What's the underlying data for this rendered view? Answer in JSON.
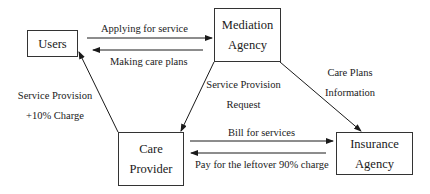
{
  "diagram": {
    "nodes": {
      "users": {
        "lines": [
          "Users"
        ]
      },
      "mediation": {
        "lines": [
          "Mediation",
          "Agency"
        ]
      },
      "care": {
        "lines": [
          "Care",
          "Provider"
        ]
      },
      "insurance": {
        "lines": [
          "Insurance",
          "Agency"
        ]
      }
    },
    "edges": {
      "applying": {
        "label": "Applying for service",
        "from": "Users",
        "to": "Mediation Agency"
      },
      "making_plans": {
        "label": "Making care plans",
        "from": "Mediation Agency",
        "to": "Users"
      },
      "service_provision": {
        "label_lines": [
          "Service Provision",
          "+10% Charge"
        ],
        "from": "Care Provider",
        "to": "Users"
      },
      "service_request": {
        "label_lines": [
          "Service Provision",
          "Request"
        ],
        "from": "Mediation Agency",
        "to": "Care Provider"
      },
      "care_plans_info": {
        "label_lines": [
          "Care Plans",
          "Information"
        ],
        "from": "Mediation Agency",
        "to": "Insurance Agency"
      },
      "bill": {
        "label": "Bill for services",
        "from": "Care Provider",
        "to": "Insurance Agency"
      },
      "pay_leftover": {
        "label": "Pay for the leftover 90% charge",
        "from": "Insurance Agency",
        "to": "Care Provider"
      }
    },
    "colors": {
      "line": "#1a1a1a",
      "box_border": "#333333",
      "background": "#ffffff"
    }
  }
}
